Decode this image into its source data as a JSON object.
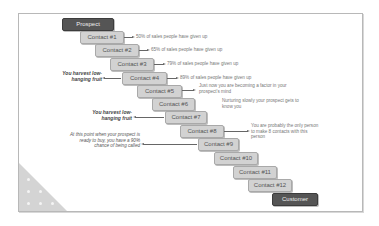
{
  "diagram": {
    "start_label": "Prospect",
    "end_label": "Customer",
    "contacts": [
      {
        "label": "Contact #1"
      },
      {
        "label": "Contact #2"
      },
      {
        "label": "Contact #3"
      },
      {
        "label": "Contact #4"
      },
      {
        "label": "Contact #5"
      },
      {
        "label": "Contact #6"
      },
      {
        "label": "Contact #7"
      },
      {
        "label": "Contact #8"
      },
      {
        "label": "Contact #9"
      },
      {
        "label": "Contact #10"
      },
      {
        "label": "Contact #11"
      },
      {
        "label": "Contact #12"
      }
    ],
    "right_notes": {
      "c1": "50% of sales people have given up",
      "c2": "65% of sales people have given up",
      "c3": "79% of sales people have given up",
      "c4": "89% of sales people have given up",
      "c5_line1": "Just now you are becoming a factor in your",
      "c5_line2": "prospect's mind",
      "c6_line1": "Nurturing slowly your prospect gets to",
      "c6_line2": "know you",
      "c8_line1": "You are probably the only person",
      "c8_line2": "to make 8 contacts with this",
      "c8_line3": "person"
    },
    "left_notes": {
      "c4_line1": "You harvest low-",
      "c4_line2": "hanging fruit",
      "c7_line1": "You harvest low-",
      "c7_line2": "hanging fruit",
      "c9_line1": "At this point when your prospect is",
      "c9_line2": "ready to buy, you have a 90%",
      "c9_line3": "chance of being called"
    },
    "colors": {
      "endpoint_box": "#555555",
      "contact_box": "#d2d2d2",
      "frame_border": "#b8b8b8"
    }
  }
}
